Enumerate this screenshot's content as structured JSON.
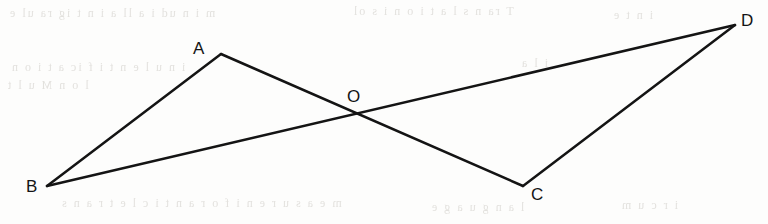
{
  "figure": {
    "width": 768,
    "height": 224,
    "background_color": "#fdfdfc",
    "stroke_color": "#141414",
    "stroke_width": 2.5,
    "points": {
      "A": {
        "label": "A",
        "x": 221,
        "y": 54,
        "label_x": 193,
        "label_y": 40
      },
      "B": {
        "label": "B",
        "x": 47,
        "y": 186,
        "label_x": 26,
        "label_y": 178
      },
      "C": {
        "label": "C",
        "x": 523,
        "y": 186,
        "label_x": 531,
        "label_y": 186
      },
      "D": {
        "label": "D",
        "x": 735,
        "y": 25,
        "label_x": 741,
        "label_y": 12
      },
      "O": {
        "label": "O",
        "x": 356,
        "y": 114,
        "label_x": 347,
        "label_y": 88
      }
    },
    "segments": [
      {
        "name": "segment-b-a",
        "from": "B",
        "to": "A"
      },
      {
        "name": "segment-a-c",
        "from": "A",
        "to": "C"
      },
      {
        "name": "segment-b-d",
        "from": "B",
        "to": "D"
      },
      {
        "name": "segment-c-d",
        "from": "C",
        "to": "D"
      }
    ],
    "intersection": {
      "name": "O",
      "of": [
        "segment-a-c",
        "segment-b-d"
      ]
    }
  },
  "background_artifacts": {
    "description": "Faint mirrored bleed-through text from the reverse side of the scanned page",
    "lines": [
      {
        "text": "m  i  n  ud  i  a  ll  a  i  n  t  ig  ra  ul  e",
        "x": 8,
        "y": 6,
        "size": 12
      },
      {
        "text": "T  ra  n  s  l  a  t  i  o  n  i  s  ol",
        "x": 352,
        "y": 4,
        "size": 12
      },
      {
        "text": "i  n  t  e",
        "x": 612,
        "y": 8,
        "size": 12
      },
      {
        "text": "i  n  u  l  e  n  t  i  f  ic  a  t  i  o  n",
        "x": 10,
        "y": 60,
        "size": 12
      },
      {
        "text": "i  l  a",
        "x": 520,
        "y": 56,
        "size": 12
      },
      {
        "text": "l  o  n  M  u  l  t",
        "x": 6,
        "y": 78,
        "size": 12
      },
      {
        "text": "m  e  a  s  u  r  e  n  i  f  o  r  a  n  t  i  c  l  e  t  r  a  n  s",
        "x": 60,
        "y": 196,
        "size": 12
      },
      {
        "text": "l  a  n  g  u  a  g  e",
        "x": 430,
        "y": 200,
        "size": 12
      },
      {
        "text": "i  r  c  u  m",
        "x": 620,
        "y": 198,
        "size": 12
      }
    ]
  }
}
